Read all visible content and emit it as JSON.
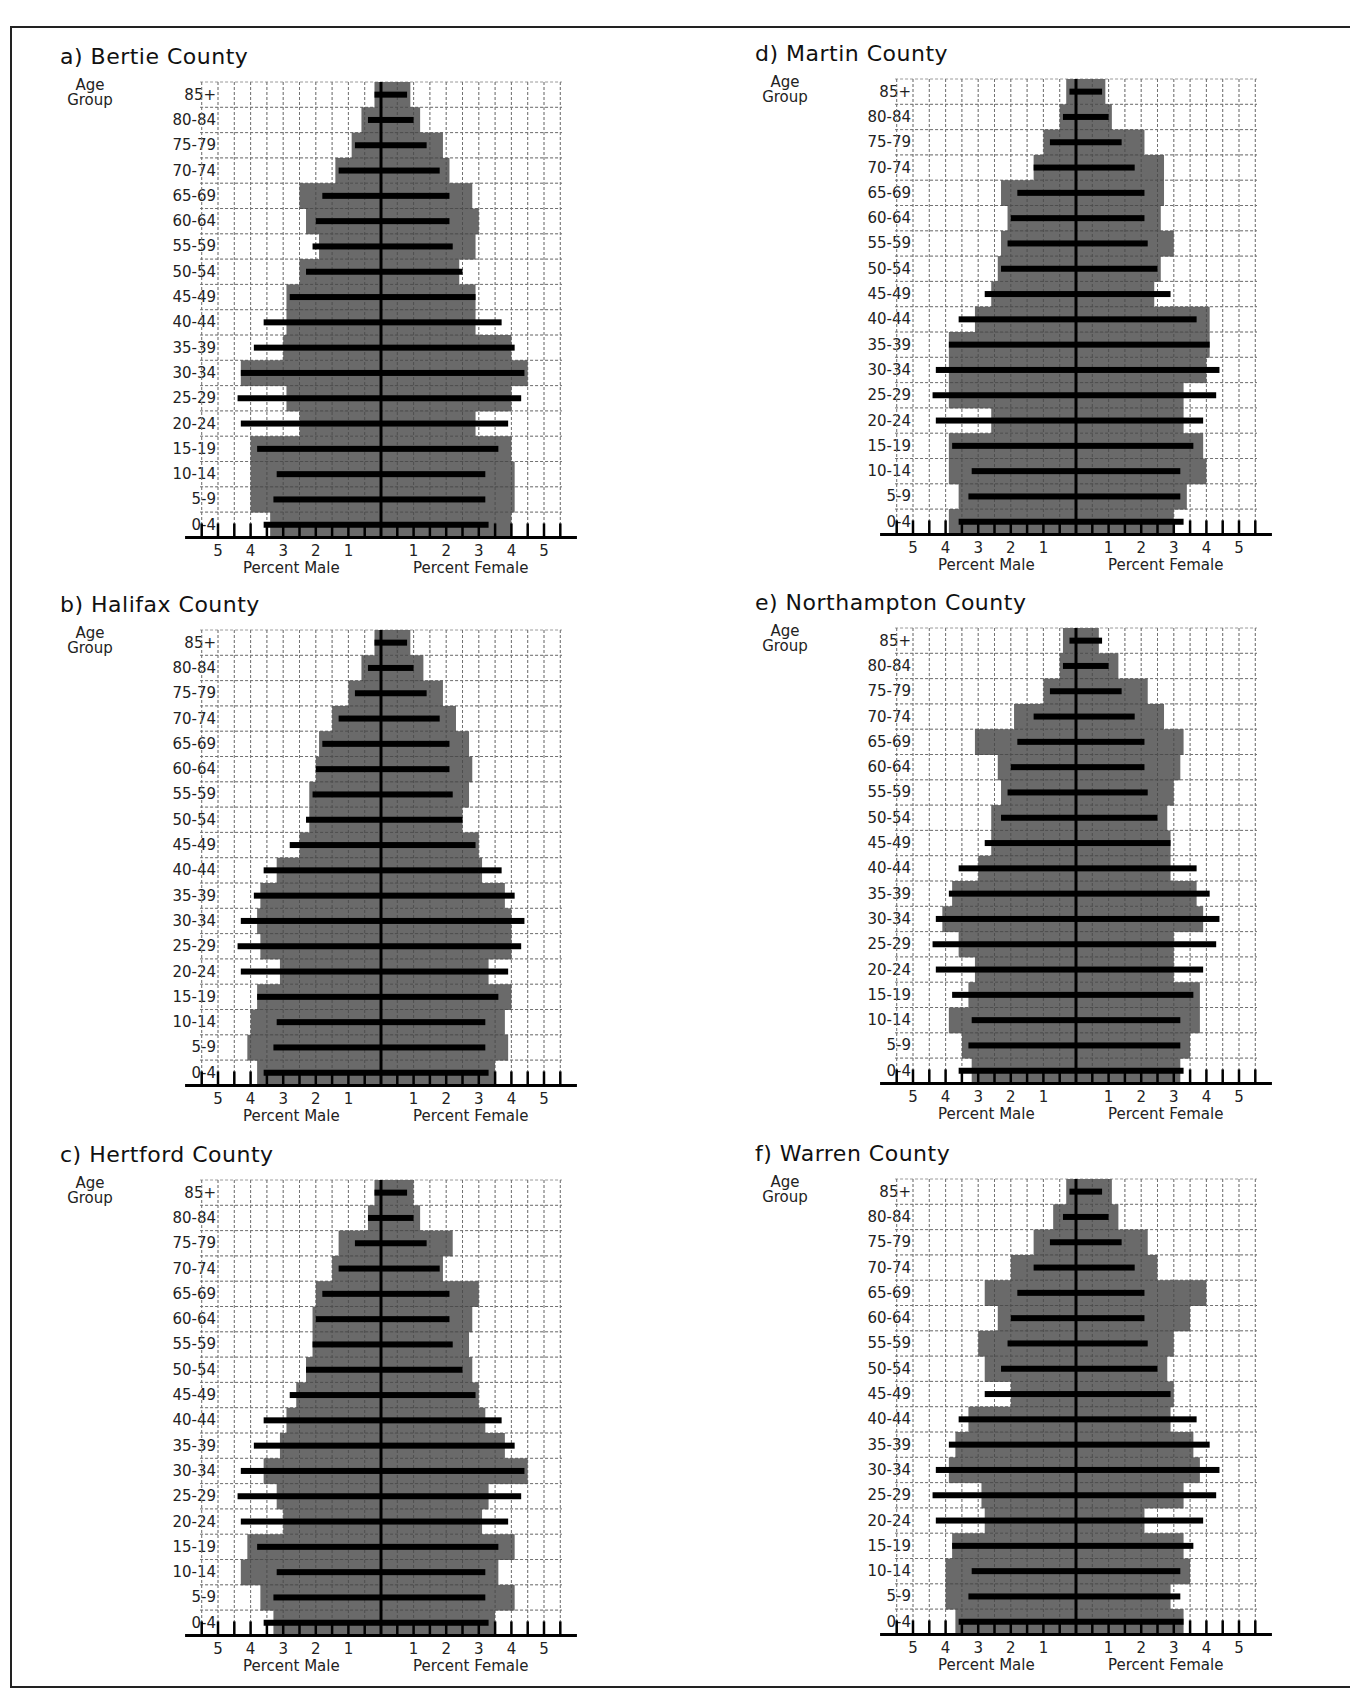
{
  "figure": {
    "age_group_header": [
      "Age",
      "Group"
    ],
    "age_groups": [
      "85+",
      "80-84",
      "75-79",
      "70-74",
      "65-69",
      "60-64",
      "55-59",
      "50-54",
      "45-49",
      "40-44",
      "35-39",
      "30-34",
      "25-29",
      "20-24",
      "15-19",
      "10-14",
      "5-9",
      "0-4"
    ],
    "axis": {
      "male_title": "Percent Male",
      "female_title": "Percent Female",
      "male_ticks": [
        "5",
        "4",
        "3",
        "2",
        "1"
      ],
      "female_ticks": [
        "1",
        "2",
        "3",
        "4",
        "5"
      ]
    },
    "colors": {
      "county_bar": "#5f5f5f",
      "reference_bar": "#000000",
      "grid": "#9a9a9a"
    }
  },
  "panels": [
    {
      "id": "a",
      "title": "a) Bertie County"
    },
    {
      "id": "b",
      "title": "b) Halifax County"
    },
    {
      "id": "c",
      "title": "c) Hertford County"
    },
    {
      "id": "d",
      "title": "d) Martin County"
    },
    {
      "id": "e",
      "title": "e) Northampton County"
    },
    {
      "id": "f",
      "title": "f) Warren County"
    }
  ],
  "chart_data": [
    {
      "type": "bar",
      "subtype": "population-pyramid",
      "title": "a) Bertie County",
      "xlabel": "Percent Male / Percent Female",
      "ylabel": "Age Group",
      "xlim": [
        -5.5,
        5.5
      ],
      "grid": true,
      "categories": [
        "85+",
        "80-84",
        "75-79",
        "70-74",
        "65-69",
        "60-64",
        "55-59",
        "50-54",
        "45-49",
        "40-44",
        "35-39",
        "30-34",
        "25-29",
        "20-24",
        "15-19",
        "10-14",
        "5-9",
        "0-4"
      ],
      "series": [
        {
          "name": "County Male (gray)",
          "values": [
            0.2,
            0.6,
            0.9,
            1.4,
            2.5,
            2.3,
            1.9,
            2.5,
            2.9,
            2.9,
            3.0,
            4.3,
            2.9,
            2.5,
            4.0,
            4.0,
            4.0,
            3.4
          ]
        },
        {
          "name": "County Female (gray)",
          "values": [
            0.9,
            1.2,
            1.9,
            2.1,
            2.8,
            3.0,
            2.9,
            2.4,
            2.9,
            2.9,
            4.0,
            4.5,
            4.0,
            2.9,
            4.0,
            4.1,
            4.1,
            4.0
          ]
        },
        {
          "name": "Reference Male (black)",
          "values": [
            0.2,
            0.4,
            0.8,
            1.3,
            1.8,
            2.0,
            2.1,
            2.3,
            2.8,
            3.6,
            3.9,
            4.3,
            4.4,
            4.3,
            3.8,
            3.2,
            3.3,
            3.6
          ]
        },
        {
          "name": "Reference Female (black)",
          "values": [
            0.8,
            1.0,
            1.4,
            1.8,
            2.1,
            2.1,
            2.2,
            2.5,
            2.9,
            3.7,
            4.1,
            4.4,
            4.3,
            3.9,
            3.6,
            3.2,
            3.2,
            3.3
          ]
        }
      ]
    },
    {
      "type": "bar",
      "subtype": "population-pyramid",
      "title": "b) Halifax County",
      "xlabel": "Percent Male / Percent Female",
      "ylabel": "Age Group",
      "xlim": [
        -5.5,
        5.5
      ],
      "grid": true,
      "categories": [
        "85+",
        "80-84",
        "75-79",
        "70-74",
        "65-69",
        "60-64",
        "55-59",
        "50-54",
        "45-49",
        "40-44",
        "35-39",
        "30-34",
        "25-29",
        "20-24",
        "15-19",
        "10-14",
        "5-9",
        "0-4"
      ],
      "series": [
        {
          "name": "County Male (gray)",
          "values": [
            0.2,
            0.6,
            1.0,
            1.5,
            1.9,
            2.0,
            2.2,
            2.2,
            2.5,
            3.2,
            3.7,
            3.8,
            3.7,
            3.1,
            3.8,
            4.0,
            4.1,
            3.8
          ]
        },
        {
          "name": "County Female (gray)",
          "values": [
            0.9,
            1.3,
            1.9,
            2.3,
            2.7,
            2.8,
            2.7,
            2.5,
            3.0,
            3.1,
            3.8,
            4.0,
            4.0,
            3.3,
            4.0,
            3.8,
            3.9,
            3.5
          ]
        },
        {
          "name": "Reference Male (black)",
          "values": [
            0.2,
            0.4,
            0.8,
            1.3,
            1.8,
            2.0,
            2.1,
            2.3,
            2.8,
            3.6,
            3.9,
            4.3,
            4.4,
            4.3,
            3.8,
            3.2,
            3.3,
            3.6
          ]
        },
        {
          "name": "Reference Female (black)",
          "values": [
            0.8,
            1.0,
            1.4,
            1.8,
            2.1,
            2.1,
            2.2,
            2.5,
            2.9,
            3.7,
            4.1,
            4.4,
            4.3,
            3.9,
            3.6,
            3.2,
            3.2,
            3.3
          ]
        }
      ]
    },
    {
      "type": "bar",
      "subtype": "population-pyramid",
      "title": "c) Hertford County",
      "xlabel": "Percent Male / Percent Female",
      "ylabel": "Age Group",
      "xlim": [
        -5.5,
        5.5
      ],
      "grid": true,
      "categories": [
        "85+",
        "80-84",
        "75-79",
        "70-74",
        "65-69",
        "60-64",
        "55-59",
        "50-54",
        "45-49",
        "40-44",
        "35-39",
        "30-34",
        "25-29",
        "20-24",
        "15-19",
        "10-14",
        "5-9",
        "0-4"
      ],
      "series": [
        {
          "name": "County Male (gray)",
          "values": [
            0.2,
            0.4,
            1.3,
            1.5,
            2.0,
            2.1,
            2.1,
            2.3,
            2.6,
            2.9,
            3.1,
            3.6,
            3.2,
            3.0,
            4.1,
            4.3,
            3.7,
            3.3
          ]
        },
        {
          "name": "County Female (gray)",
          "values": [
            1.0,
            1.2,
            2.2,
            1.9,
            3.0,
            2.8,
            2.7,
            2.8,
            3.0,
            3.2,
            3.8,
            4.5,
            3.3,
            3.1,
            4.1,
            3.6,
            4.1,
            3.5
          ]
        },
        {
          "name": "Reference Male (black)",
          "values": [
            0.2,
            0.4,
            0.8,
            1.3,
            1.8,
            2.0,
            2.1,
            2.3,
            2.8,
            3.6,
            3.9,
            4.3,
            4.4,
            4.3,
            3.8,
            3.2,
            3.3,
            3.6
          ]
        },
        {
          "name": "Reference Female (black)",
          "values": [
            0.8,
            1.0,
            1.4,
            1.8,
            2.1,
            2.1,
            2.2,
            2.5,
            2.9,
            3.7,
            4.1,
            4.4,
            4.3,
            3.9,
            3.6,
            3.2,
            3.2,
            3.3
          ]
        }
      ]
    },
    {
      "type": "bar",
      "subtype": "population-pyramid",
      "title": "d) Martin County",
      "xlabel": "Percent Male / Percent Female",
      "ylabel": "Age Group",
      "xlim": [
        -5.5,
        5.5
      ],
      "grid": true,
      "categories": [
        "85+",
        "80-84",
        "75-79",
        "70-74",
        "65-69",
        "60-64",
        "55-59",
        "50-54",
        "45-49",
        "40-44",
        "35-39",
        "30-34",
        "25-29",
        "20-24",
        "15-19",
        "10-14",
        "5-9",
        "0-4"
      ],
      "series": [
        {
          "name": "County Male (gray)",
          "values": [
            0.3,
            0.5,
            1.0,
            1.3,
            2.3,
            2.1,
            2.3,
            2.4,
            2.6,
            3.1,
            3.9,
            3.9,
            3.9,
            2.6,
            3.9,
            3.9,
            3.6,
            3.9
          ]
        },
        {
          "name": "County Female (gray)",
          "values": [
            0.9,
            1.1,
            2.1,
            2.7,
            2.7,
            2.6,
            3.0,
            2.6,
            2.4,
            4.1,
            4.1,
            4.0,
            3.3,
            3.3,
            3.9,
            4.0,
            3.4,
            3.0
          ]
        },
        {
          "name": "Reference Male (black)",
          "values": [
            0.2,
            0.4,
            0.8,
            1.3,
            1.8,
            2.0,
            2.1,
            2.3,
            2.8,
            3.6,
            3.9,
            4.3,
            4.4,
            4.3,
            3.8,
            3.2,
            3.3,
            3.6
          ]
        },
        {
          "name": "Reference Female (black)",
          "values": [
            0.8,
            1.0,
            1.4,
            1.8,
            2.1,
            2.1,
            2.2,
            2.5,
            2.9,
            3.7,
            4.1,
            4.4,
            4.3,
            3.9,
            3.6,
            3.2,
            3.2,
            3.3
          ]
        }
      ]
    },
    {
      "type": "bar",
      "subtype": "population-pyramid",
      "title": "e) Northampton County",
      "xlabel": "Percent Male / Percent Female",
      "ylabel": "Age Group",
      "xlim": [
        -5.5,
        5.5
      ],
      "grid": true,
      "categories": [
        "85+",
        "80-84",
        "75-79",
        "70-74",
        "65-69",
        "60-64",
        "55-59",
        "50-54",
        "45-49",
        "40-44",
        "35-39",
        "30-34",
        "25-29",
        "20-24",
        "15-19",
        "10-14",
        "5-9",
        "0-4"
      ],
      "series": [
        {
          "name": "County Male (gray)",
          "values": [
            0.4,
            0.5,
            1.0,
            1.9,
            3.1,
            2.4,
            2.3,
            2.6,
            2.6,
            3.0,
            3.8,
            4.1,
            3.6,
            3.1,
            3.3,
            3.9,
            3.5,
            3.2
          ]
        },
        {
          "name": "County Female (gray)",
          "values": [
            0.7,
            1.3,
            2.2,
            2.7,
            3.3,
            3.2,
            3.0,
            2.8,
            2.9,
            2.9,
            3.7,
            3.9,
            3.0,
            3.0,
            3.8,
            3.8,
            3.5,
            3.2
          ]
        },
        {
          "name": "Reference Male (black)",
          "values": [
            0.2,
            0.4,
            0.8,
            1.3,
            1.8,
            2.0,
            2.1,
            2.3,
            2.8,
            3.6,
            3.9,
            4.3,
            4.4,
            4.3,
            3.8,
            3.2,
            3.3,
            3.6
          ]
        },
        {
          "name": "Reference Female (black)",
          "values": [
            0.8,
            1.0,
            1.4,
            1.8,
            2.1,
            2.1,
            2.2,
            2.5,
            2.9,
            3.7,
            4.1,
            4.4,
            4.3,
            3.9,
            3.6,
            3.2,
            3.2,
            3.3
          ]
        }
      ]
    },
    {
      "type": "bar",
      "subtype": "population-pyramid",
      "title": "f) Warren County",
      "xlabel": "Percent Male / Percent Female",
      "ylabel": "Age Group",
      "xlim": [
        -5.5,
        5.5
      ],
      "grid": true,
      "categories": [
        "85+",
        "80-84",
        "75-79",
        "70-74",
        "65-69",
        "60-64",
        "55-59",
        "50-54",
        "45-49",
        "40-44",
        "35-39",
        "30-34",
        "25-29",
        "20-24",
        "15-19",
        "10-14",
        "5-9",
        "0-4"
      ],
      "series": [
        {
          "name": "County Male (gray)",
          "values": [
            0.3,
            0.7,
            1.3,
            2.0,
            2.8,
            2.4,
            3.0,
            2.8,
            2.0,
            3.3,
            3.7,
            3.9,
            2.9,
            2.8,
            3.8,
            4.0,
            4.0,
            3.7
          ]
        },
        {
          "name": "County Female (gray)",
          "values": [
            1.1,
            1.3,
            2.2,
            2.5,
            4.0,
            3.5,
            3.0,
            2.8,
            3.0,
            2.9,
            3.6,
            3.8,
            3.3,
            2.1,
            3.3,
            3.5,
            2.9,
            3.3
          ]
        },
        {
          "name": "Reference Male (black)",
          "values": [
            0.2,
            0.4,
            0.8,
            1.3,
            1.8,
            2.0,
            2.1,
            2.3,
            2.8,
            3.6,
            3.9,
            4.3,
            4.4,
            4.3,
            3.8,
            3.2,
            3.3,
            3.6
          ]
        },
        {
          "name": "Reference Female (black)",
          "values": [
            0.8,
            1.0,
            1.4,
            1.8,
            2.1,
            2.1,
            2.2,
            2.5,
            2.9,
            3.7,
            4.1,
            4.4,
            4.3,
            3.9,
            3.6,
            3.2,
            3.2,
            3.3
          ]
        }
      ]
    }
  ]
}
